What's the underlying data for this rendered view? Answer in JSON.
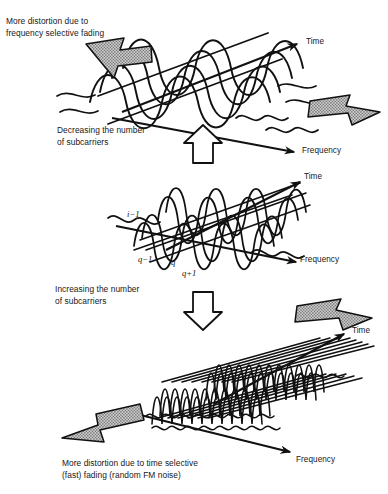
{
  "figure": {
    "background_color": "#ffffff",
    "ink_color": "#111111",
    "arrow_fill_color": "#9a9a9a",
    "arrow_outline_color": "#111111"
  },
  "captions": {
    "top": "More distortion due to\nfrequency selective fading",
    "decreasing": "Decreasing the number\nof subcarriers",
    "increasing": "Increasing the number\nof subcarriers",
    "bottom": "More distortion due to time selective\n(fast) fading (random FM noise)"
  },
  "axis_labels": {
    "time_top": "Time",
    "frequency_top": "Frequency",
    "time_middle": "Time",
    "frequency_middle": "Frequency",
    "time_bottom": "Time",
    "frequency_bottom": "Frequency"
  },
  "subcarrier_indices": {
    "i_minus_1": "i−1",
    "q_minus_1": "q−1",
    "q": "q",
    "q_plus_1": "q+1"
  },
  "panels": [
    {
      "id": "panel-top",
      "name": "few-wide-subcarriers",
      "description": "Small number of wide subcarriers drawn as broad overlapping sinusoid envelopes",
      "subcarrier_count": 5,
      "subcarrier_width_px": 46,
      "subcarrier_height_px": 42,
      "distortion": "frequency selective fading"
    },
    {
      "id": "panel-middle",
      "name": "intermediate-subcarriers",
      "description": "Intermediate number of subcarriers with labelled indices q−1, q, q+1 and i−1",
      "subcarrier_count": 9,
      "subcarrier_width_px": 25,
      "subcarrier_height_px": 40,
      "distortion": "balanced"
    },
    {
      "id": "panel-bottom",
      "name": "many-narrow-subcarriers",
      "description": "Large number of narrow tall subcarriers packed densely along the frequency axis",
      "subcarrier_count": 22,
      "subcarrier_width_px": 10,
      "subcarrier_height_px": 56,
      "distortion": "time selective (fast) fading, random FM noise"
    }
  ],
  "block_arrows": [
    {
      "name": "distortion-arrow-top-left",
      "direction": "right",
      "style": "stippled-gray"
    },
    {
      "name": "distortion-arrow-top-right",
      "direction": "left",
      "style": "stippled-gray"
    },
    {
      "name": "decrease-arrow",
      "direction": "up",
      "style": "outline-white"
    },
    {
      "name": "increase-arrow",
      "direction": "down",
      "style": "outline-white"
    },
    {
      "name": "distortion-arrow-bottom-right",
      "direction": "left",
      "style": "stippled-gray"
    },
    {
      "name": "distortion-arrow-bottom-left",
      "direction": "right",
      "style": "stippled-gray"
    }
  ]
}
